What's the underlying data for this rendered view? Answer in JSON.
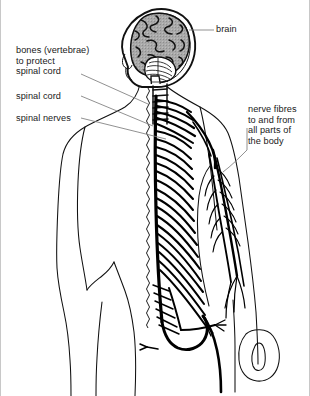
{
  "figure": {
    "width": 310,
    "height": 396,
    "background_color": "#ffffff",
    "line_color": "#000000",
    "text_color": "#1a1a1a",
    "brain_fill_color": "#a8a8a8",
    "leader_line_color": "#777777",
    "border_color": "#c8c8c8"
  },
  "labels": {
    "brain": "brain",
    "bones": "bones (vertebrae)\nto protect\nspinal cord",
    "spinal_cord": "spinal cord",
    "spinal_nerves": "spinal nerves",
    "nerve_fibres": "nerve fibres\nto and from\nall parts of\nthe body"
  },
  "parts": [
    {
      "name": "brain",
      "label": "brain",
      "side": "right"
    },
    {
      "name": "vertebrae",
      "label": "bones (vertebrae) to protect spinal cord",
      "side": "left"
    },
    {
      "name": "spinal-cord",
      "label": "spinal cord",
      "side": "left"
    },
    {
      "name": "spinal-nerves",
      "label": "spinal nerves",
      "side": "left"
    },
    {
      "name": "nerve-fibres",
      "label": "nerve fibres to and from all parts of the body",
      "side": "right"
    }
  ]
}
